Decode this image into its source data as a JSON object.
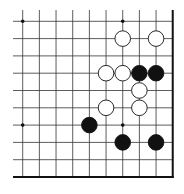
{
  "board": {
    "description": "Go board lower-right corner fragment",
    "columns": 10,
    "rows": 10,
    "origin_x": 22.7,
    "origin_y": 21.3,
    "step_x": 16.67,
    "step_y": 17.3,
    "left_extent_x": 13,
    "top_extent_y": 10,
    "edges": [
      "right",
      "bottom"
    ],
    "colors": {
      "line": "#333333",
      "edge": "#111111",
      "black": "#111111",
      "white": "#ffffff",
      "background": "#ffffff"
    },
    "star_points": [
      {
        "col": 0,
        "row": 0
      },
      {
        "col": 6,
        "row": 0
      },
      {
        "col": 0,
        "row": 6
      },
      {
        "col": 6,
        "row": 6
      }
    ],
    "stones": [
      {
        "color": "white",
        "col": 6,
        "row": 1
      },
      {
        "color": "white",
        "col": 8,
        "row": 1
      },
      {
        "color": "white",
        "col": 5,
        "row": 3
      },
      {
        "color": "white",
        "col": 6,
        "row": 3
      },
      {
        "color": "black",
        "col": 7,
        "row": 3
      },
      {
        "color": "black",
        "col": 8,
        "row": 3
      },
      {
        "color": "white",
        "col": 7,
        "row": 4
      },
      {
        "color": "white",
        "col": 5,
        "row": 5
      },
      {
        "color": "white",
        "col": 7,
        "row": 5
      },
      {
        "color": "black",
        "col": 4,
        "row": 6
      },
      {
        "color": "black",
        "col": 6,
        "row": 7
      },
      {
        "color": "black",
        "col": 8,
        "row": 7
      }
    ]
  }
}
